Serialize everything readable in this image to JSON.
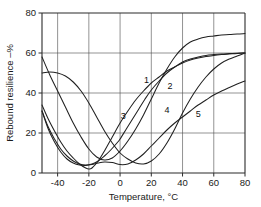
{
  "chart_data": {
    "type": "line",
    "title": "",
    "xlabel": "Temperature, °C",
    "ylabel": "Rebound resilience –%",
    "xlim": [
      -50,
      80
    ],
    "ylim": [
      0,
      80
    ],
    "xticks": [
      -40,
      -20,
      0,
      20,
      40,
      60,
      80
    ],
    "xtick_labels": [
      "-40",
      "-20",
      "0",
      "20",
      "40",
      "60",
      "80"
    ],
    "yticks": [
      0,
      20,
      40,
      60,
      80
    ],
    "ytick_labels": [
      "0",
      "20",
      "40",
      "60",
      "80"
    ],
    "grid": true,
    "legend": "inline-curve-numbers",
    "series": [
      {
        "name": "1",
        "label": "1",
        "label_x": 17,
        "label_y": 45,
        "x": [
          -50,
          -45,
          -40,
          -35,
          -30,
          -25,
          -20,
          -15,
          -10,
          -5,
          0,
          5,
          10,
          15,
          20,
          25,
          30,
          35,
          40,
          45,
          50,
          55,
          60,
          65,
          70,
          75,
          80
        ],
        "y": [
          58,
          49,
          41,
          33,
          25,
          18,
          12,
          8,
          6.5,
          7.5,
          11,
          16,
          22,
          29,
          37,
          45,
          52,
          58,
          62.5,
          65.5,
          67,
          68,
          68.5,
          69,
          69.2,
          69.5,
          69.7
        ]
      },
      {
        "name": "2",
        "label": "2",
        "label_x": 32,
        "label_y": 42,
        "x": [
          -50,
          -45,
          -40,
          -35,
          -30,
          -25,
          -20,
          -15,
          -10,
          -5,
          0,
          5,
          10,
          15,
          20,
          25,
          30,
          35,
          40,
          45,
          50,
          55,
          60,
          65,
          70,
          75,
          80
        ],
        "y": [
          50,
          50.5,
          50,
          48.5,
          45.5,
          41,
          35,
          28,
          21,
          15,
          10,
          7,
          5,
          4.5,
          6,
          9.5,
          15,
          22,
          30,
          37,
          43,
          48,
          52,
          55,
          57,
          58.5,
          60
        ]
      },
      {
        "name": "3",
        "label": "3",
        "label_x": 2,
        "label_y": 27,
        "x": [
          -50,
          -46,
          -42,
          -38,
          -34,
          -30,
          -26,
          -22,
          -20,
          -18,
          -14,
          -10,
          -5,
          0,
          5,
          10,
          15,
          20,
          25,
          30,
          35,
          40,
          45,
          50,
          55,
          60,
          65,
          70,
          75,
          80
        ],
        "y": [
          34,
          27,
          21,
          15.5,
          11,
          7.5,
          4.5,
          2.5,
          2,
          2.5,
          6,
          11,
          18,
          25,
          31,
          36.5,
          41,
          45,
          48,
          51,
          53,
          55,
          56.5,
          57.5,
          58.2,
          58.8,
          59.2,
          59.5,
          59.8,
          60
        ]
      },
      {
        "name": "4",
        "label": "4",
        "label_x": 30,
        "label_y": 30,
        "x": [
          -50,
          -46,
          -42,
          -38,
          -34,
          -30,
          -26,
          -22,
          -18,
          -14,
          -10,
          -6,
          -2,
          0,
          4,
          8,
          12,
          16,
          20,
          25,
          30,
          35,
          40,
          45,
          50,
          55,
          60,
          65,
          70,
          75,
          80
        ],
        "y": [
          31,
          23,
          17,
          12,
          8.5,
          6,
          4.5,
          4,
          4.5,
          6,
          8.5,
          11.5,
          15,
          17,
          22,
          27,
          32,
          37,
          41.5,
          46,
          50,
          53,
          55.5,
          57,
          58,
          58.8,
          59.2,
          59.5,
          59.7,
          59.9,
          60
        ]
      },
      {
        "name": "5",
        "label": "5",
        "label_x": 50,
        "label_y": 28,
        "x": [
          -50,
          -46,
          -42,
          -38,
          -34,
          -30,
          -26,
          -22,
          -18,
          -14,
          -10,
          -5,
          0,
          5,
          10,
          15,
          20,
          25,
          30,
          35,
          40,
          45,
          50,
          55,
          60,
          65,
          70,
          75,
          80
        ],
        "y": [
          31,
          22,
          15.5,
          10.5,
          7,
          5,
          4,
          3.8,
          4.2,
          5,
          5.5,
          5.2,
          4.2,
          4.5,
          6.5,
          9.5,
          13.5,
          17.5,
          21.5,
          25,
          28,
          31,
          34,
          36.5,
          39,
          41,
          42.8,
          44.5,
          46
        ]
      }
    ]
  }
}
